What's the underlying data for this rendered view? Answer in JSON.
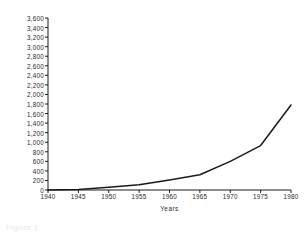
{
  "chart_data": {
    "type": "line",
    "title": "",
    "xlabel": "Years",
    "ylabel": "Thousands of students",
    "x": [
      1940,
      1945,
      1950,
      1955,
      1960,
      1965,
      1970,
      1975,
      1980
    ],
    "values": [
      0,
      10,
      55,
      110,
      210,
      320,
      600,
      930,
      1780
    ],
    "xlim": [
      1940,
      1980
    ],
    "ylim": [
      0,
      3600
    ],
    "xticks": [
      1940,
      1945,
      1950,
      1955,
      1960,
      1965,
      1970,
      1975,
      1980
    ],
    "xtick_labels": [
      "1940",
      "1945",
      "1950",
      "1955",
      "1960",
      "1965",
      "1970",
      "1975",
      "1980"
    ],
    "yticks": [
      0,
      200,
      400,
      600,
      800,
      1000,
      1200,
      1400,
      1600,
      1800,
      2000,
      2200,
      2400,
      2600,
      2800,
      3000,
      3200,
      3400,
      3600
    ],
    "ytick_labels": [
      "0",
      "200",
      "400",
      "600",
      "800",
      "1,000",
      "1,200",
      "1,400",
      "1,600",
      "1,800",
      "2,000",
      "2,200",
      "2,400",
      "2,600",
      "2,800",
      "3,000",
      "3,200",
      "3,400",
      "3,600"
    ],
    "grid": false,
    "legend": false,
    "line_color": "#1a1a1a",
    "axis_color": "#1a1a1a"
  },
  "caption": {
    "text": "Figure 1"
  }
}
